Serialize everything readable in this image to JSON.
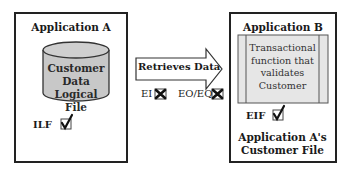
{
  "application_a": {
    "title": "Application A",
    "data_store": {
      "line1": "Customer",
      "line2": "Data",
      "line3": "Logical File",
      "fill_color": "#c8c8c8"
    },
    "ilf_label": "ILF",
    "ilf_check": "✓"
  },
  "flow": {
    "arrow_label": "Retrieves Data",
    "ei_label": "EI",
    "eo_eq_label": "EO/EQ",
    "ei_mark": "✗",
    "eo_eq_mark": "✗"
  },
  "application_b": {
    "title": "Application B",
    "process": {
      "line1": "Transactional",
      "line2": "function that",
      "line3": "validates",
      "line4": "Customer",
      "fill_color": "#e6e6e6"
    },
    "eif_label": "EIF",
    "eif_check": "✓",
    "caption_line1": "Application A's",
    "caption_line2": "Customer File"
  }
}
